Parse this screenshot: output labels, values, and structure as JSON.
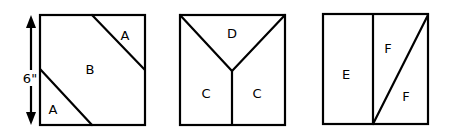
{
  "dimension": {
    "label": "6\""
  },
  "blocks": [
    {
      "name": "block-1",
      "labels": [
        "A",
        "B",
        "A"
      ]
    },
    {
      "name": "block-2",
      "labels": [
        "D",
        "C",
        "C"
      ]
    },
    {
      "name": "block-3",
      "labels": [
        "E",
        "F",
        "F"
      ]
    }
  ]
}
